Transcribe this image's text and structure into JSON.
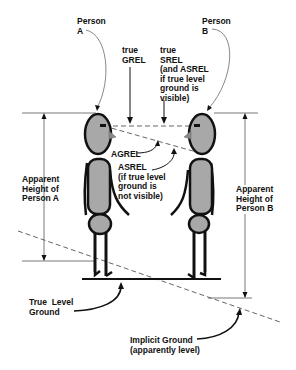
{
  "labels": {
    "person_a": "Person\nA",
    "person_b": "Person\nB",
    "true_grel": "true\nGREL",
    "true_srel": "true\nSREL\n(and ASREL\nif true level\nground is\nvisible)",
    "agrel": "AGREL",
    "asrel": "ASREL\n(if true level\nground is\nnot visible)",
    "apparent_height_a": "Apparent\nHeight of\nPerson A",
    "apparent_height_b": "Apparent\nHeight of\nPerson B",
    "true_level_ground": "True  Level\nGround",
    "implicit_ground": "Implicit Ground\n(apparently level)"
  },
  "colors": {
    "figure_fill": "#a8a8a8",
    "stroke": "#111111",
    "guide_line": "#555555"
  }
}
